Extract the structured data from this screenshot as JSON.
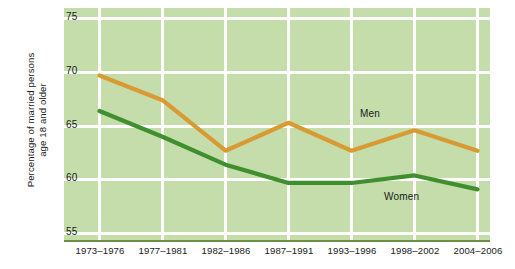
{
  "chart_data": {
    "type": "line",
    "title": "",
    "xlabel": "",
    "ylabel": "Percentage of married persons age 18 and older",
    "ylabel_line1": "Percentage of married persons",
    "ylabel_line2": "age 18 and older",
    "categories": [
      "1973–1976",
      "1977–1981",
      "1982–1986",
      "1987–1991",
      "1993–1996",
      "1998–2002",
      "2004–2006"
    ],
    "yticks": [
      "75",
      "70",
      "65",
      "60",
      "55"
    ],
    "ytick_values": [
      75,
      70,
      65,
      60,
      55
    ],
    "ylim": [
      55,
      75
    ],
    "grid": true,
    "legend_position": "inline-annotations",
    "series": [
      {
        "name": "Men",
        "color": "#d99a33",
        "values": [
          69.7,
          67.4,
          62.7,
          65.3,
          62.7,
          64.6,
          62.7
        ],
        "annotation": "Men"
      },
      {
        "name": "Women",
        "color": "#3f8f2e",
        "values": [
          66.4,
          64.0,
          61.4,
          59.7,
          59.7,
          60.4,
          59.1
        ],
        "annotation": "Women"
      }
    ],
    "plot_background": "#c4ddab",
    "gridline_color": "#ffffff",
    "axis_color": "#6c8f47"
  },
  "annotations": {
    "men_label": "Men",
    "women_label": "Women"
  }
}
